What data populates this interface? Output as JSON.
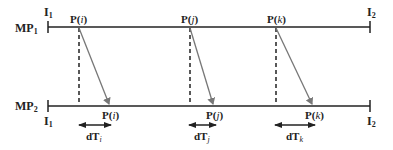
{
  "diagram": {
    "lines": [
      {
        "id": "MP1",
        "label": "MP",
        "sub": "1",
        "start_label": "I",
        "start_sub": "1",
        "end_label": "I",
        "end_sub": "2"
      },
      {
        "id": "MP2",
        "label": "MP",
        "sub": "2",
        "start_label": "I",
        "start_sub": "1",
        "end_label": "I",
        "end_sub": "2"
      }
    ],
    "events": [
      {
        "name": "P",
        "index": "i",
        "delta_label": "dT",
        "delta_sub": "i"
      },
      {
        "name": "P",
        "index": "j",
        "delta_label": "dT",
        "delta_sub": "j"
      },
      {
        "name": "P",
        "index": "k",
        "delta_label": "dT",
        "delta_sub": "k"
      }
    ],
    "colors": {
      "line": "#222222",
      "arrow": "#777777",
      "dashed": "#222222"
    }
  }
}
